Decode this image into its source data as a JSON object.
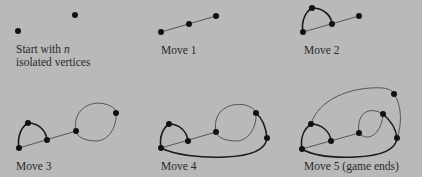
{
  "figure": {
    "panels": [
      {
        "id": "start",
        "caption_line1": "Start with ",
        "caption_var": "n",
        "caption_line2": "isolated vertices"
      },
      {
        "id": "move1",
        "caption": "Move 1"
      },
      {
        "id": "move2",
        "caption": "Move 2"
      },
      {
        "id": "move3",
        "caption": "Move 3"
      },
      {
        "id": "move4",
        "caption": "Move 4"
      },
      {
        "id": "move5",
        "caption": "Move 5 (game ends)"
      }
    ],
    "colors": {
      "background": "#b9b9b9",
      "vertex": "#111111",
      "thin_edge": "#555555",
      "thick_edge": "#1a1a1a",
      "text": "#2a2a2a"
    }
  }
}
